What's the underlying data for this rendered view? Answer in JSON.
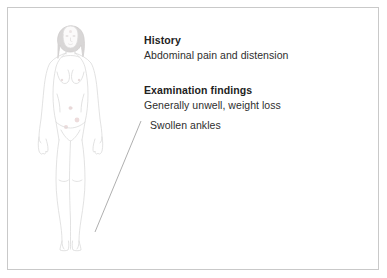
{
  "page": {
    "background_color": "#ffffff",
    "frame_color": "#c9c9c9"
  },
  "illustration": {
    "name": "female-body-front-view",
    "outline_color": "#d9d9d9",
    "shading_color": "#eceaea",
    "hair_color": "#d2d0d0",
    "mark_color": "#e8cfcf",
    "description": "Line drawing of a standing female figure, front view, arms at sides"
  },
  "leader_line": {
    "color": "#9a9a9a",
    "from_label": "Swollen ankles",
    "to_target": "ankle"
  },
  "annotations": [
    {
      "id": "history",
      "heading": "History",
      "lines": [
        "Abdominal pain and distension"
      ]
    },
    {
      "id": "examination-findings",
      "heading": "Examination findings",
      "lines": [
        "Generally unwell, weight loss",
        "Swollen ankles"
      ]
    }
  ],
  "labels": {
    "history_heading": "History",
    "history_line_1": "Abdominal pain and distension",
    "exam_heading": "Examination findings",
    "exam_line_1": "Generally unwell, weight loss",
    "exam_line_2": "Swollen ankles"
  }
}
